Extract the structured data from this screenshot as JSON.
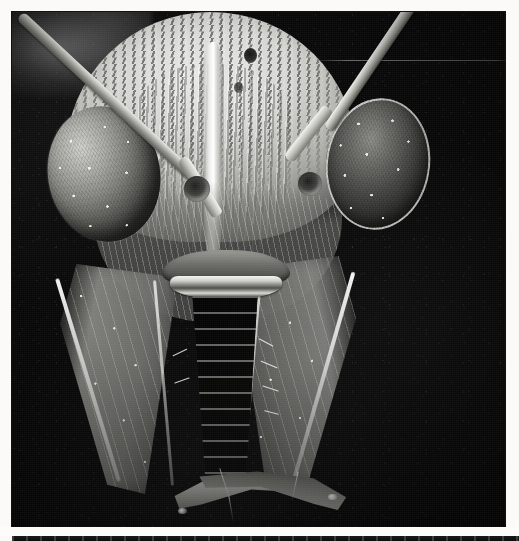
{
  "page": {
    "background_color": "#fbfaf8"
  },
  "figure": {
    "name": "sem-micrograph",
    "imaging_modality": "scanning electron microscope",
    "palette": {
      "background": "#070707",
      "specimen_light": "#e9e9e6",
      "specimen_mid": "#8e8e89",
      "specimen_dark": "#2c2c2a",
      "page": "#fbfaf8"
    },
    "frame": {
      "left": 12,
      "top": 12,
      "width": 493,
      "height": 515
    },
    "parts": [
      {
        "id": "vertex",
        "label": "vertex / frons with coarse punctation"
      },
      {
        "id": "frontal-carina",
        "label": "median frontal carina"
      },
      {
        "id": "ocellus",
        "label": "ocellus pit"
      },
      {
        "id": "eye-left",
        "label": "left compound eye"
      },
      {
        "id": "eye-right",
        "label": "right compound eye"
      },
      {
        "id": "antenna-left",
        "label": "left antenna"
      },
      {
        "id": "antenna-right",
        "label": "right antenna"
      },
      {
        "id": "torulus-left",
        "label": "left antennal socket"
      },
      {
        "id": "torulus-right",
        "label": "right antennal socket"
      },
      {
        "id": "gena-left",
        "label": "left gena / malar space"
      },
      {
        "id": "gena-right",
        "label": "right gena / malar space"
      },
      {
        "id": "clypeus",
        "label": "clypeus"
      },
      {
        "id": "labrum",
        "label": "labrum"
      },
      {
        "id": "glossa",
        "label": "glossa / proboscis, segmented"
      },
      {
        "id": "mandible-left",
        "label": "left mandible"
      },
      {
        "id": "mandible-right",
        "label": "right mandible"
      }
    ]
  },
  "next_figure": {
    "name": "next-micrograph-strip",
    "note": "top edge of the following micrograph visible below the gutter"
  }
}
